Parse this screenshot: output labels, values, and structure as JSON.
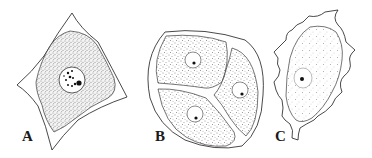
{
  "figure": {
    "panels": [
      {
        "label": "A",
        "description": "polygonal cell with large nucleus and dark chromatin granules"
      },
      {
        "label": "B",
        "description": "oval cell divided into three compartments, each with a nucleus"
      },
      {
        "label": "C",
        "description": "irregular cell with spiky outer membrane and a single nucleus"
      }
    ]
  },
  "colors": {
    "ink": "#1a1a1a",
    "background": "#ffffff"
  }
}
